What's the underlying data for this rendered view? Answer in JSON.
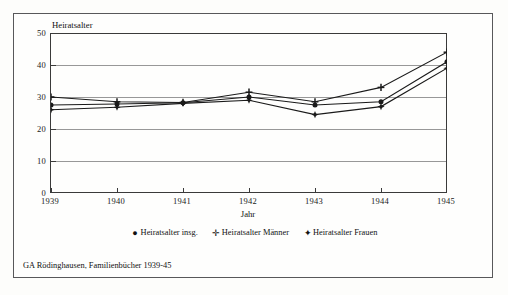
{
  "figure": {
    "caption": "GA Rödinghausen, Familienbücher 1939-45",
    "background_color": "#fdfdfb",
    "frame_color": "#58585a"
  },
  "chart_data": {
    "type": "line",
    "title": "",
    "ylabel": "Heiratsalter",
    "xlabel": "Jahr",
    "categories": [
      "1939",
      "1940",
      "1941",
      "1942",
      "1943",
      "1944",
      "1945"
    ],
    "x": [
      1939,
      1940,
      1941,
      1942,
      1943,
      1944,
      1945
    ],
    "ylim": [
      0,
      50
    ],
    "yticks": [
      0,
      10,
      20,
      30,
      40,
      50
    ],
    "grid": true,
    "grid_axis": "y",
    "legend_position": "below",
    "series": [
      {
        "name": "Heiratsalter insg.",
        "marker": "●",
        "marker_name": "filled-circle-marker",
        "color": "#1a1a1a",
        "values": [
          27.5,
          27.8,
          28.2,
          30.0,
          27.5,
          28.5,
          41.0
        ]
      },
      {
        "name": "Heiratsalter Männer",
        "marker": "✛",
        "marker_name": "plus-marker",
        "color": "#1a1a1a",
        "values": [
          30.0,
          28.5,
          28.3,
          31.5,
          28.5,
          33.0,
          44.0
        ]
      },
      {
        "name": "Heiratsalter Frauen",
        "marker": "✦",
        "marker_name": "star-marker",
        "color": "#1a1a1a",
        "values": [
          26.0,
          26.8,
          28.0,
          29.0,
          24.5,
          27.0,
          39.0
        ]
      }
    ]
  }
}
